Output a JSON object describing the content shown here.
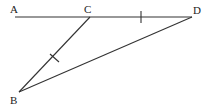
{
  "diagram": {
    "type": "geometry",
    "labels": {
      "A": "A",
      "B": "B",
      "C": "C",
      "D": "D"
    },
    "points": {
      "A": [
        15,
        17
      ],
      "C": [
        90,
        17
      ],
      "D": [
        192,
        17
      ],
      "B": [
        19,
        92
      ]
    },
    "segments": [
      "AD",
      "CB",
      "BD"
    ],
    "equal_marks": [
      "CD",
      "BC"
    ],
    "colors": {
      "stroke": "#333333",
      "text": "#222222",
      "background": "#ffffff"
    }
  }
}
